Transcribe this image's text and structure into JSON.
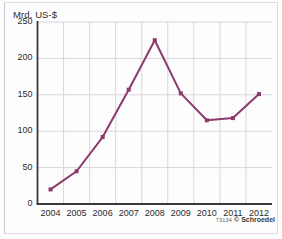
{
  "figure": {
    "axis_label_y": "Mrd. US-$",
    "credit_code": "73134",
    "credit_symbol": "©",
    "credit_brand": "Schroedel",
    "line_color": "#8d3a6b",
    "grid_color": "#d8d5dc",
    "axis_color": "#3a3a3a",
    "background": "#fdfdfd"
  },
  "chart_data": {
    "type": "line",
    "title": "",
    "xlabel": "",
    "ylabel": "Mrd. US-$",
    "categories": [
      "2004",
      "2005",
      "2006",
      "2007",
      "2008",
      "2009",
      "2010",
      "2011",
      "2012"
    ],
    "values": [
      20,
      45,
      92,
      157,
      225,
      152,
      115,
      118,
      151
    ],
    "ylim": [
      0,
      250
    ],
    "yticks": [
      0,
      50,
      100,
      150,
      200,
      250
    ],
    "ytick_labels": [
      "0",
      "50",
      "100",
      "150",
      "200",
      "250"
    ],
    "grid": true,
    "legend": false,
    "marker": "square",
    "series": [
      {
        "name": "Mrd. US-$",
        "values": [
          20,
          45,
          92,
          157,
          225,
          152,
          115,
          118,
          151
        ]
      }
    ]
  }
}
